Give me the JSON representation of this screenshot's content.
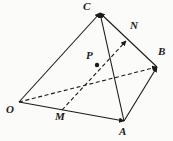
{
  "figure": {
    "background_color": "#fbfbfa",
    "stroke_color": "#1a1a1a",
    "width": 173,
    "height": 141,
    "vertices": [
      {
        "name": "O",
        "label": "O",
        "x": 19,
        "y": 102,
        "label_x": 8,
        "label_y": 106
      },
      {
        "name": "A",
        "label": "A",
        "x": 124,
        "y": 121,
        "label_x": 120,
        "label_y": 127
      },
      {
        "name": "B",
        "label": "B",
        "x": 157,
        "y": 67,
        "label_x": 157,
        "label_y": 48
      },
      {
        "name": "C",
        "label": "C",
        "x": 100,
        "y": 13,
        "label_x": 83,
        "label_y": 3
      },
      {
        "name": "M",
        "label": "M",
        "x": 68,
        "y": 107,
        "label_x": 57,
        "label_y": 112
      },
      {
        "name": "N",
        "label": "N",
        "x": 126,
        "y": 41,
        "label_x": 130,
        "label_y": 22
      },
      {
        "name": "P",
        "label": "P",
        "x": 97,
        "y": 65,
        "label_x": 86,
        "label_y": 52
      }
    ],
    "solid_edges": [
      {
        "name": "edge-O-C",
        "from": "O",
        "to": "C",
        "arrow": true
      },
      {
        "name": "edge-O-A",
        "from": "O",
        "to": "A",
        "arrow": true
      },
      {
        "name": "edge-A-C",
        "from": "A",
        "to": "C",
        "arrow": true
      },
      {
        "name": "edge-A-B",
        "from": "A",
        "to": "B",
        "arrow": true
      },
      {
        "name": "edge-B-C",
        "from": "B",
        "to": "C",
        "arrow": true
      }
    ],
    "dashed_edges": [
      {
        "name": "edge-O-B",
        "from": "O",
        "to": "B",
        "arrow": true
      },
      {
        "name": "edge-M-N",
        "from": "M",
        "to": "N",
        "arrow": true
      }
    ],
    "marked_points": [
      {
        "name": "point-P",
        "on": "segment-M-N",
        "x": 97,
        "y": 65
      }
    ]
  }
}
